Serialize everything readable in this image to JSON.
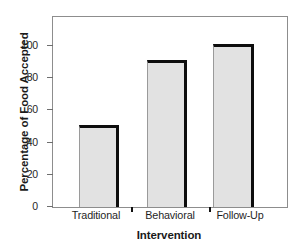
{
  "chart_data": {
    "type": "bar",
    "title": "",
    "xlabel": "Intervention",
    "ylabel": "Percentage of Food Accepted",
    "categories": [
      "Traditional",
      "Behavioral",
      "Follow-Up"
    ],
    "values": [
      51,
      91,
      101
    ],
    "ylim": [
      0,
      118
    ],
    "yticks": [
      0,
      20,
      40,
      60,
      80,
      100
    ],
    "ytick_labels": [
      "0",
      "20",
      "40",
      "60",
      "80",
      "100"
    ],
    "grid": false,
    "legend": null,
    "series": [
      {
        "name": "Percentage of Food Accepted",
        "values": [
          51,
          91,
          101
        ]
      }
    ],
    "colors": {
      "bar_fill": "#e2e2e2",
      "bar_edge": "#0d0d0d",
      "frame": "#8d8d8d",
      "text": "#1a1a1a",
      "background": "#ffffff"
    }
  }
}
